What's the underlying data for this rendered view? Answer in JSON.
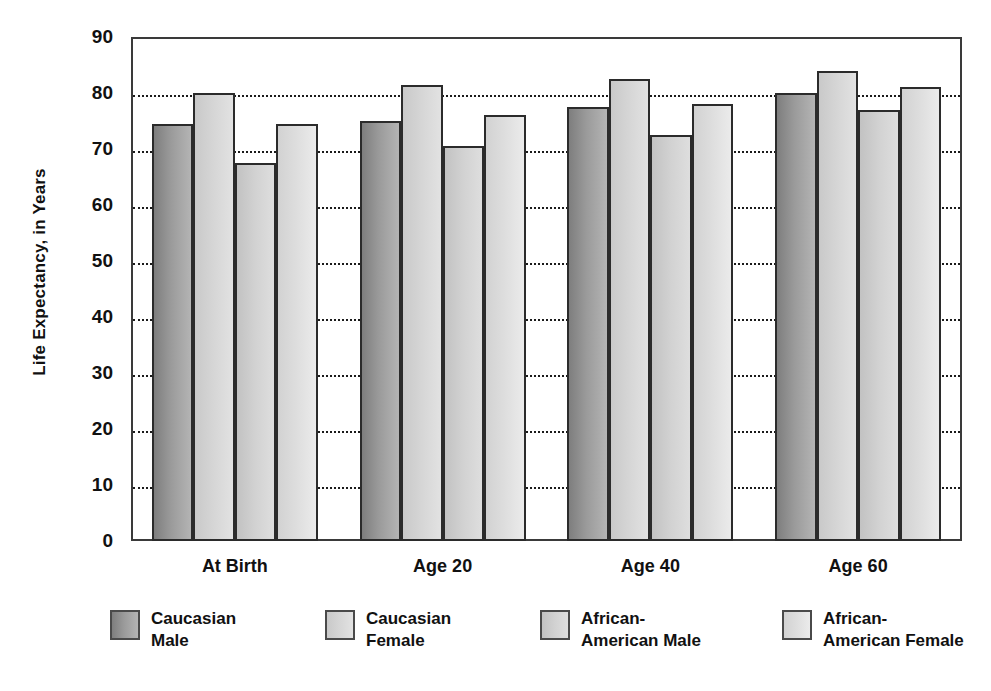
{
  "chart_data": {
    "type": "bar",
    "title": "",
    "xlabel": "",
    "ylabel": "Life Expectancy, in Years",
    "ylim": [
      0,
      90
    ],
    "ytick_step": 10,
    "yticks": [
      "90",
      "80",
      "70",
      "60",
      "50",
      "40",
      "30",
      "20",
      "10",
      "0"
    ],
    "grid": true,
    "legend_position": "bottom",
    "categories": [
      "At Birth",
      "Age 20",
      "Age 40",
      "Age 60"
    ],
    "series": [
      {
        "name": "Caucasian Male",
        "values": [
          74.5,
          75.0,
          77.5,
          80.0
        ],
        "color": "#9a9a9a"
      },
      {
        "name": "Caucasian Female",
        "values": [
          80.0,
          81.5,
          82.5,
          84.0
        ],
        "color": "#d6d6d6"
      },
      {
        "name": "African-American Male",
        "values": [
          67.5,
          70.5,
          72.5,
          77.0
        ],
        "color": "#d2d2d2"
      },
      {
        "name": "African-American Female",
        "values": [
          74.5,
          76.0,
          78.0,
          81.0
        ],
        "color": "#dedede"
      }
    ]
  },
  "legend": {
    "items": [
      {
        "label": "Caucasian\nMale"
      },
      {
        "label": "Caucasian\nFemale"
      },
      {
        "label": "African-\nAmerican Male"
      },
      {
        "label": "African-\nAmerican Female"
      }
    ]
  },
  "colors": {
    "axis": "#3a3a3a",
    "grid": "#1b1b1b",
    "text": "#111111",
    "background": "#ffffff"
  }
}
